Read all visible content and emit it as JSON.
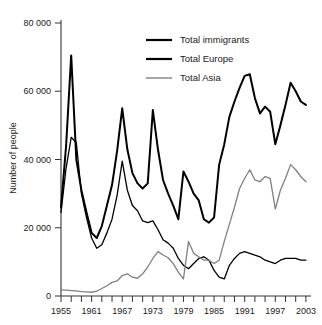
{
  "chart_data": {
    "type": "line",
    "title": "",
    "xlabel": "",
    "ylabel": "Number of people",
    "xlim": [
      1955,
      2004
    ],
    "ylim": [
      0,
      80000
    ],
    "grid": false,
    "legend_position": "top-center",
    "y_ticks": [
      0,
      20000,
      40000,
      60000,
      80000
    ],
    "y_tick_labels": [
      "0",
      "20 000",
      "40 000",
      "60 000",
      "80 000"
    ],
    "x_ticks": [
      1955,
      1957,
      1959,
      1961,
      1963,
      1965,
      1967,
      1969,
      1971,
      1973,
      1975,
      1977,
      1979,
      1981,
      1983,
      1985,
      1987,
      1989,
      1991,
      1993,
      1995,
      1997,
      1999,
      2001,
      2003
    ],
    "x_tick_labels_shown": [
      "1955",
      "1961",
      "1967",
      "1973",
      "1979",
      "1985",
      "1991",
      "1997",
      "2003"
    ],
    "x_labeled_years": [
      1955,
      1961,
      1967,
      1973,
      1979,
      1985,
      1991,
      1997,
      2003
    ],
    "x": [
      1955,
      1956,
      1957,
      1958,
      1959,
      1960,
      1961,
      1962,
      1963,
      1964,
      1965,
      1966,
      1967,
      1968,
      1969,
      1970,
      1971,
      1972,
      1973,
      1974,
      1975,
      1976,
      1977,
      1978,
      1979,
      1980,
      1981,
      1982,
      1983,
      1984,
      1985,
      1986,
      1987,
      1988,
      1989,
      1990,
      1991,
      1992,
      1993,
      1994,
      1995,
      1996,
      1997,
      1998,
      1999,
      2000,
      2001,
      2002,
      2003
    ],
    "series": [
      {
        "name": "Total immigrants",
        "color": "#000000",
        "width": 2.0,
        "values": [
          26000,
          44000,
          70500,
          40000,
          31000,
          24500,
          18500,
          17000,
          20500,
          26500,
          32500,
          42500,
          55000,
          43000,
          36000,
          33000,
          31500,
          33000,
          54500,
          43000,
          34000,
          30000,
          26500,
          22500,
          36500,
          33500,
          30000,
          28000,
          22500,
          21500,
          23000,
          38500,
          44500,
          52500,
          57000,
          61000,
          64500,
          65000,
          58000,
          53500,
          55500,
          54000,
          44500,
          50000,
          56000,
          62500,
          60000,
          57000,
          56000
        ]
      },
      {
        "name": "Total Europe",
        "color": "#000000",
        "width": 1.3,
        "values": [
          24500,
          37500,
          46500,
          45000,
          30000,
          23000,
          17000,
          14000,
          15000,
          18500,
          22500,
          29500,
          39500,
          31000,
          26500,
          25000,
          22000,
          21500,
          22000,
          19500,
          16500,
          15500,
          14000,
          11000,
          9000,
          8000,
          9500,
          11000,
          11500,
          10500,
          7500,
          5500,
          5000,
          9000,
          11000,
          12500,
          13000,
          12500,
          12000,
          11500,
          10500,
          10000,
          9500,
          10500,
          11000,
          11000,
          11000,
          10500,
          10500
        ]
      },
      {
        "name": "Total Asia",
        "color": "#808080",
        "width": 1.3,
        "values": [
          1800,
          1700,
          1600,
          1500,
          1300,
          1200,
          1100,
          1400,
          2200,
          3000,
          4000,
          4400,
          6000,
          6500,
          5500,
          5200,
          6500,
          8500,
          11000,
          13000,
          12000,
          11200,
          9500,
          7000,
          5000,
          16000,
          12500,
          11500,
          10500,
          10500,
          9500,
          10500,
          16000,
          21000,
          26000,
          31500,
          34500,
          37000,
          34000,
          33500,
          35000,
          34500,
          25500,
          31000,
          34500,
          38500,
          37000,
          35000,
          33500
        ]
      }
    ],
    "legend": [
      {
        "label": "Total immigrants",
        "color": "#000000",
        "width": 2.2
      },
      {
        "label": "Total Europe",
        "color": "#000000",
        "width": 2.2
      },
      {
        "label": "Total Asia",
        "color": "#808080",
        "width": 1.4
      }
    ]
  }
}
